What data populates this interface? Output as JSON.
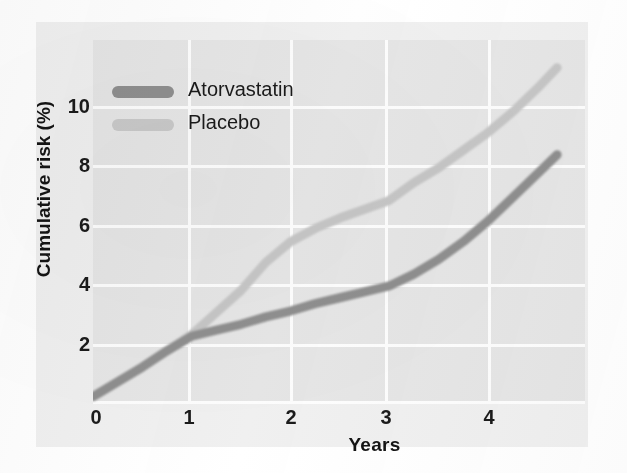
{
  "chart_data": {
    "type": "line",
    "title": "",
    "xlabel": "Years",
    "ylabel": "Cumulative risk (%)",
    "xlim": [
      0,
      4.75
    ],
    "ylim": [
      0,
      11.6
    ],
    "xticks": [
      0,
      1,
      2,
      3,
      4
    ],
    "xtick_labels": [
      "0",
      "1",
      "2",
      "3",
      "4"
    ],
    "yticks": [
      2,
      4,
      6,
      8,
      10
    ],
    "ytick_labels": [
      "2",
      "4",
      "6",
      "8",
      "10"
    ],
    "grid": true,
    "legend_position": "upper left",
    "series": [
      {
        "name": "Atorvastatin",
        "color": "#8f8f8f",
        "x": [
          0,
          0.25,
          0.5,
          0.75,
          1.0,
          1.25,
          1.5,
          1.75,
          2.0,
          2.25,
          2.5,
          2.75,
          3.0,
          3.25,
          3.5,
          3.75,
          4.0,
          4.25,
          4.5,
          4.7
        ],
        "y": [
          0.15,
          0.65,
          1.15,
          1.7,
          2.2,
          2.4,
          2.6,
          2.85,
          3.05,
          3.3,
          3.5,
          3.7,
          3.9,
          4.3,
          4.8,
          5.4,
          6.1,
          6.9,
          7.7,
          8.35
        ]
      },
      {
        "name": "Placebo",
        "color": "#c6c6c6",
        "x": [
          0,
          0.25,
          0.5,
          0.75,
          1.0,
          1.25,
          1.5,
          1.75,
          2.0,
          2.25,
          2.5,
          2.75,
          3.0,
          3.25,
          3.5,
          3.75,
          4.0,
          4.25,
          4.5,
          4.7
        ],
        "y": [
          0.15,
          0.65,
          1.15,
          1.7,
          2.25,
          3.0,
          3.75,
          4.7,
          5.4,
          5.85,
          6.2,
          6.5,
          6.8,
          7.4,
          7.9,
          8.5,
          9.1,
          9.8,
          10.6,
          11.3
        ]
      }
    ],
    "annotations": [
      "Curves overlap from 0 to ~1 year then diverge",
      "Placebo rises faster than Atorvastatin after year 1"
    ]
  },
  "legend": {
    "items": [
      {
        "label": "Atorvastatin",
        "color": "#8f8f8f"
      },
      {
        "label": "Placebo",
        "color": "#c9c9c9"
      }
    ]
  },
  "axes": {
    "x_title": "Years",
    "y_title": "Cumulative risk (%)",
    "x_tick_labels": [
      "0",
      "1",
      "2",
      "3",
      "4"
    ],
    "y_tick_labels": [
      "10",
      "8",
      "6",
      "4",
      "2"
    ]
  },
  "colors": {
    "plot_background": "#e6e6e6",
    "paper_background": "#f0f0f0",
    "gridline": "#fdfdfd",
    "atorvastatin": "#8f8f8f",
    "placebo": "#c9c9c9",
    "text": "#1a1a1a"
  }
}
